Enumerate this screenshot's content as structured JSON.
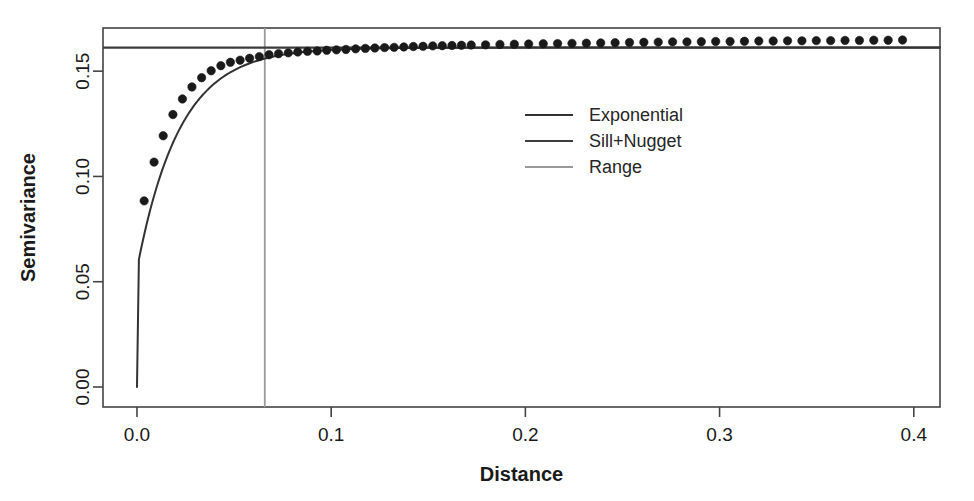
{
  "chart_data": {
    "type": "scatter",
    "title": "",
    "xlabel": "Distance",
    "ylabel": "Semivariance",
    "xlim": [
      -0.0175,
      0.4135
    ],
    "ylim": [
      -0.0095,
      0.1705
    ],
    "xticks": [
      0.0,
      0.1,
      0.2,
      0.3,
      0.4
    ],
    "xtick_labels": [
      "0.0",
      "0.1",
      "0.2",
      "0.3",
      "0.4"
    ],
    "yticks": [
      0.0,
      0.05,
      0.1,
      0.15
    ],
    "ytick_labels": [
      "0.00",
      "0.05",
      "0.10",
      "0.15"
    ],
    "grid": false,
    "legend_position": "center",
    "legend": [
      {
        "label": "Exponential",
        "color": "#333333",
        "type": "line"
      },
      {
        "label": "Sill+Nugget",
        "color": "#3d3d3d",
        "type": "line"
      },
      {
        "label": "Range",
        "color": "#9a9a9a",
        "type": "line"
      }
    ],
    "annotations": {
      "nugget": 0.056,
      "sill_plus_nugget": 0.1612,
      "range": 0.0658,
      "partial_sill": 0.1052,
      "practical_range_multiplier": 3
    },
    "series": [
      {
        "name": "Empirical semivariogram",
        "type": "scatter",
        "marker": "filled-circle",
        "color": "#1a1a1a",
        "points": [
          {
            "x": 0.0037,
            "y": 0.0884
          },
          {
            "x": 0.0088,
            "y": 0.1068
          },
          {
            "x": 0.0135,
            "y": 0.1193
          },
          {
            "x": 0.0185,
            "y": 0.1294
          },
          {
            "x": 0.0234,
            "y": 0.1368
          },
          {
            "x": 0.0283,
            "y": 0.1425
          },
          {
            "x": 0.0333,
            "y": 0.1469
          },
          {
            "x": 0.0382,
            "y": 0.1502
          },
          {
            "x": 0.0432,
            "y": 0.1526
          },
          {
            "x": 0.0481,
            "y": 0.1542
          },
          {
            "x": 0.0531,
            "y": 0.1552
          },
          {
            "x": 0.058,
            "y": 0.1561
          },
          {
            "x": 0.063,
            "y": 0.1569
          },
          {
            "x": 0.068,
            "y": 0.1578
          },
          {
            "x": 0.0729,
            "y": 0.1583
          },
          {
            "x": 0.0779,
            "y": 0.1587
          },
          {
            "x": 0.0828,
            "y": 0.1591
          },
          {
            "x": 0.0878,
            "y": 0.1594
          },
          {
            "x": 0.0928,
            "y": 0.1596
          },
          {
            "x": 0.0977,
            "y": 0.1599
          },
          {
            "x": 0.1027,
            "y": 0.1601
          },
          {
            "x": 0.1076,
            "y": 0.1603
          },
          {
            "x": 0.1126,
            "y": 0.1606
          },
          {
            "x": 0.1176,
            "y": 0.1608
          },
          {
            "x": 0.1225,
            "y": 0.161
          },
          {
            "x": 0.1275,
            "y": 0.1612
          },
          {
            "x": 0.1324,
            "y": 0.1613
          },
          {
            "x": 0.1374,
            "y": 0.1615
          },
          {
            "x": 0.1423,
            "y": 0.1617
          },
          {
            "x": 0.1473,
            "y": 0.1618
          },
          {
            "x": 0.1523,
            "y": 0.162
          },
          {
            "x": 0.1572,
            "y": 0.1621
          },
          {
            "x": 0.1622,
            "y": 0.1622
          },
          {
            "x": 0.1671,
            "y": 0.1623
          },
          {
            "x": 0.1721,
            "y": 0.1624
          },
          {
            "x": 0.1795,
            "y": 0.1625
          },
          {
            "x": 0.1869,
            "y": 0.1627
          },
          {
            "x": 0.1943,
            "y": 0.1628
          },
          {
            "x": 0.2017,
            "y": 0.1629
          },
          {
            "x": 0.2092,
            "y": 0.163
          },
          {
            "x": 0.2166,
            "y": 0.1631
          },
          {
            "x": 0.224,
            "y": 0.1632
          },
          {
            "x": 0.2314,
            "y": 0.1633
          },
          {
            "x": 0.2388,
            "y": 0.1634
          },
          {
            "x": 0.2462,
            "y": 0.1635
          },
          {
            "x": 0.2536,
            "y": 0.1636
          },
          {
            "x": 0.261,
            "y": 0.1637
          },
          {
            "x": 0.2684,
            "y": 0.1638
          },
          {
            "x": 0.2758,
            "y": 0.1639
          },
          {
            "x": 0.2832,
            "y": 0.1639
          },
          {
            "x": 0.2906,
            "y": 0.164
          },
          {
            "x": 0.298,
            "y": 0.1641
          },
          {
            "x": 0.3054,
            "y": 0.1641
          },
          {
            "x": 0.3128,
            "y": 0.1642
          },
          {
            "x": 0.3202,
            "y": 0.1643
          },
          {
            "x": 0.3276,
            "y": 0.1643
          },
          {
            "x": 0.335,
            "y": 0.1644
          },
          {
            "x": 0.3424,
            "y": 0.1644
          },
          {
            "x": 0.3498,
            "y": 0.1645
          },
          {
            "x": 0.3572,
            "y": 0.1645
          },
          {
            "x": 0.3646,
            "y": 0.1646
          },
          {
            "x": 0.372,
            "y": 0.1646
          },
          {
            "x": 0.3794,
            "y": 0.1647
          },
          {
            "x": 0.3868,
            "y": 0.1647
          },
          {
            "x": 0.3942,
            "y": 0.1648
          }
        ]
      }
    ]
  }
}
